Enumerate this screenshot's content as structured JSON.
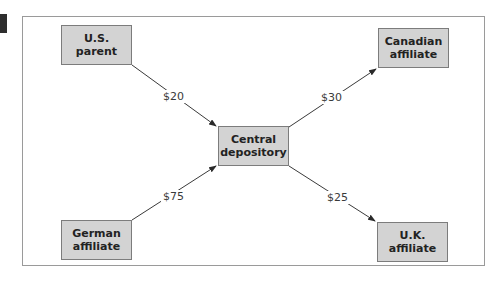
{
  "diagram": {
    "nodes": [
      {
        "id": "us_parent",
        "label": "U.S.\nparent"
      },
      {
        "id": "canadian_affiliate",
        "label": "Canadian\naffiliate"
      },
      {
        "id": "central_depository",
        "label": "Central\ndepository"
      },
      {
        "id": "german_affiliate",
        "label": "German\naffiliate"
      },
      {
        "id": "uk_affiliate",
        "label": "U.K.\naffiliate"
      }
    ],
    "edges": [
      {
        "from": "us_parent",
        "to": "central_depository",
        "label": "$20"
      },
      {
        "from": "central_depository",
        "to": "canadian_affiliate",
        "label": "$30"
      },
      {
        "from": "german_affiliate",
        "to": "central_depository",
        "label": "$75"
      },
      {
        "from": "central_depository",
        "to": "uk_affiliate",
        "label": "$25"
      }
    ]
  },
  "colors": {
    "node_fill": "#d3d3d3",
    "node_border": "#7c7c7c",
    "arrow": "#3a3a3a",
    "frame": "#9a9a9a"
  }
}
